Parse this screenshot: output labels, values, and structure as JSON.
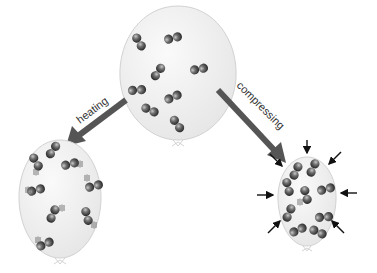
{
  "diagram": {
    "labels": {
      "heating": "heating",
      "compressing": "compressing"
    },
    "balloons": [
      {
        "id": "original",
        "state": "initial gas, normal motion",
        "molecule_count": 8
      },
      {
        "id": "heated",
        "state": "heated - faster molecular motion, larger balloon",
        "molecule_count": 10
      },
      {
        "id": "compressed",
        "state": "compressed - smaller balloon, external pressure",
        "molecule_count": 10
      }
    ],
    "colors": {
      "balloon_fill": "#efefef",
      "balloon_stroke": "#d0d0d0",
      "arrow": "#555555",
      "molecule": "#5a5a5a",
      "pressure_arrows": "#111111"
    },
    "icons": [
      "molecule-icon",
      "arrow-icon",
      "pressure-arrow-icon"
    ]
  }
}
